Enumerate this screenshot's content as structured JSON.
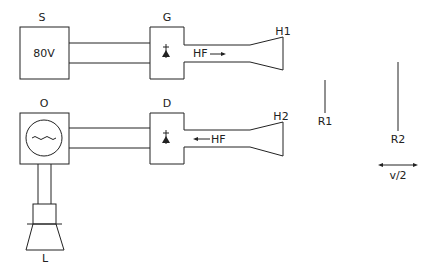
{
  "diagram": {
    "type": "microwave-doppler-setup",
    "blocks": {
      "source": {
        "label": "S",
        "value": "80V"
      },
      "generator": {
        "label": "G"
      },
      "detector": {
        "label": "D"
      },
      "oscilloscope": {
        "label": "O"
      },
      "loudspeaker": {
        "label": "L"
      }
    },
    "horns": {
      "transmit": {
        "label": "H1"
      },
      "receive": {
        "label": "H2"
      }
    },
    "signals": {
      "forward": {
        "label": "HF",
        "direction": "right"
      },
      "return": {
        "label": "HF",
        "direction": "left"
      }
    },
    "reflectors": {
      "fixed": {
        "label": "R1"
      },
      "moving": {
        "label": "R2",
        "motion_label": "v/2"
      }
    },
    "colors": {
      "line": "#222222",
      "background": "#ffffff"
    }
  }
}
